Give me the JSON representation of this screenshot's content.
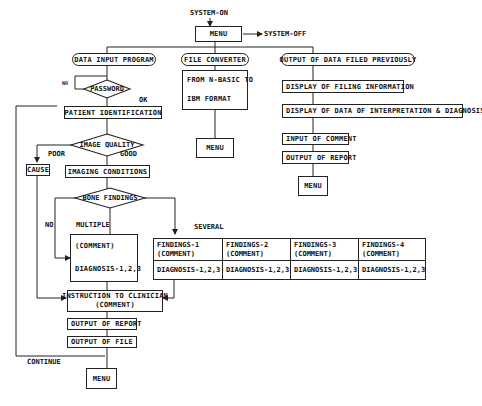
{
  "top": {
    "system_on": "SYSTEM-ON",
    "menu": "MENU",
    "system_off": "SYSTEM-OFF"
  },
  "branches": {
    "data_input": "DATA INPUT PROGRAM",
    "file_converter": "FILE CONVERTER",
    "output_previous": "OUTPUT OF DATA FILED PREVIOUSLY"
  },
  "data_input": {
    "password": "PASSWORD",
    "no_label": "NO",
    "ok_label": "OK",
    "patient_id": "PATIENT IDENTIFICATION",
    "image_quality": "IMAGE QUALITY",
    "poor_label": "POOR",
    "good_label": "GOOD",
    "cause": "CAUSE",
    "imaging_conditions": "IMAGING CONDITIONS",
    "bone_findings": "BONE FINDINGS",
    "no2_label": "NO",
    "multiple_label": "MULTIPLE",
    "several_label": "SEVERAL",
    "multiple_box": {
      "comment": "(COMMENT)",
      "diagnosis": "DIAGNOSIS-1,2,3"
    },
    "findings": [
      {
        "title": "FINDINGS-1",
        "comment": "(COMMENT)",
        "diagnosis": "DIAGNOSIS-1,2,3"
      },
      {
        "title": "FINDINGS-2",
        "comment": "(COMMENT)",
        "diagnosis": "DIAGNOSIS-1,2,3"
      },
      {
        "title": "FINDINGS-3",
        "comment": "(COMMENT)",
        "diagnosis": "DIAGNOSIS-1,2,3"
      },
      {
        "title": "FINDINGS-4",
        "comment": "(COMMENT)",
        "diagnosis": "DIAGNOSIS-1,2,3"
      }
    ],
    "instruction_line1": "INSTRUCTION TO CLINICIAN",
    "instruction_line2": "(COMMENT)",
    "output_report": "OUTPUT OF REPORT",
    "output_file": "OUTPUT OF FILE",
    "continue_label": "CONTINUE",
    "menu": "MENU"
  },
  "file_converter": {
    "line1": "FROM N-BASIC TO",
    "line2": "IBM FORMAT",
    "menu": "MENU"
  },
  "output_previous": {
    "filing_info": "DISPLAY OF FILING INFORMATION",
    "interpretation": "DISPLAY OF DATA OF INTERPRETATION & DIAGNOSIS",
    "input_comment": "INPUT OF COMMENT",
    "output_report": "OUTPUT OF REPORT",
    "menu": "MENU"
  }
}
